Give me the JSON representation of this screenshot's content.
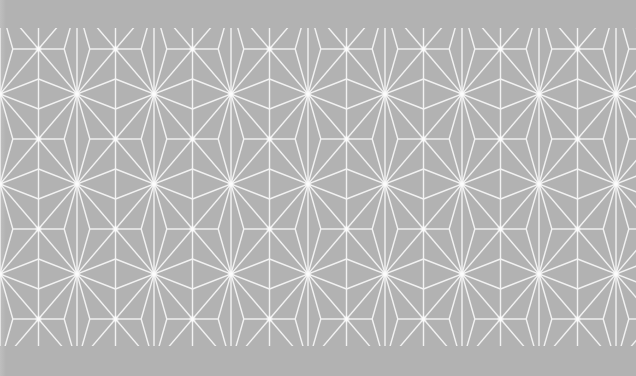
{
  "image": {
    "subject": "Asanoha (hemp leaf) geometric pattern",
    "colors": {
      "background": "#b2b2b2",
      "lines": "#f4f4f4",
      "star_glow": "#ffffff"
    },
    "pattern": {
      "column_spacing_px": 77,
      "row_spacing_px": 45,
      "band_top_px": 28,
      "band_bottom_px": 346
    }
  }
}
